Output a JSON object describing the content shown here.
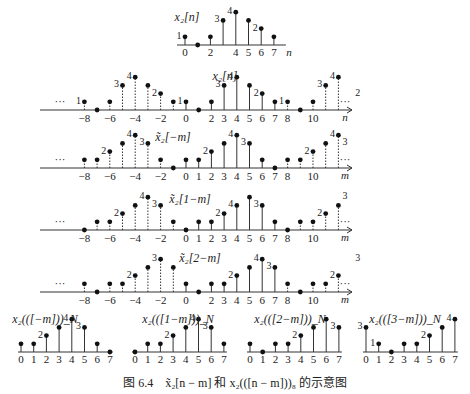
{
  "figure": {
    "caption_prefix": "图 6.4",
    "caption_text": "x̃₂[n − m] 和 x₂(([n − m]))₈ 的示意图"
  },
  "chart_data": [
    {
      "type": "stem",
      "id": "x2",
      "title": "x₂[n]",
      "axis_label": "n",
      "x": [
        0,
        1,
        2,
        3,
        4,
        5,
        6,
        7
      ],
      "values": [
        1,
        0,
        1,
        3,
        4,
        3,
        2,
        1
      ],
      "tick_labels": [
        "0",
        "2",
        "4",
        "5",
        "6",
        "7"
      ],
      "value_labels": {
        "0": "1",
        "3": "3",
        "4": "4",
        "6": "2"
      }
    },
    {
      "type": "stem",
      "id": "x2_periodic",
      "title": "x₂[n]",
      "axis_label": "n",
      "periodic": true,
      "period": 8,
      "x_range": [
        -9,
        14
      ],
      "base_values": [
        1,
        0,
        1,
        3,
        4,
        3,
        2,
        1
      ],
      "tick_labels": [
        "-8",
        "-6",
        "-4",
        "-2",
        "0",
        "2",
        "3",
        "4",
        "5",
        "6",
        "7",
        "8",
        "10"
      ],
      "ellipsis": "···"
    },
    {
      "type": "stem",
      "id": "x2_tilde_neg_m",
      "title": "x̃₂[−m]",
      "axis_label": "m",
      "periodic": true,
      "period": 8,
      "base_values": [
        1,
        1,
        2,
        3,
        4,
        3,
        1,
        0
      ],
      "tick_labels": [
        "-8",
        "-6",
        "-4",
        "-2",
        "0",
        "1",
        "2",
        "3",
        "4",
        "5",
        "6",
        "7",
        "8",
        "10"
      ]
    },
    {
      "type": "stem",
      "id": "x2_tilde_1_minus_m",
      "title": "x̃₂[1−m]",
      "axis_label": "m",
      "periodic": true,
      "period": 8,
      "base_values": [
        0,
        1,
        1,
        2,
        3,
        4,
        3,
        1
      ],
      "tick_labels": [
        "-8",
        "-6",
        "-4",
        "-2",
        "0",
        "1",
        "2",
        "3",
        "4",
        "5",
        "6",
        "7",
        "8",
        "10"
      ]
    },
    {
      "type": "stem",
      "id": "x2_tilde_2_minus_m",
      "title": "x̃₂[2−m]",
      "axis_label": "m",
      "periodic": true,
      "period": 8,
      "base_values": [
        1,
        0,
        1,
        1,
        2,
        3,
        4,
        3
      ],
      "tick_labels": [
        "-8",
        "-6",
        "-4",
        "-2",
        "0",
        "2",
        "3",
        "4",
        "5",
        "6",
        "7",
        "8",
        "10"
      ]
    },
    {
      "type": "stem",
      "id": "x2_circ_neg_m",
      "title": "x₂(([−m]))_N",
      "x": [
        0,
        1,
        2,
        3,
        4,
        5,
        6,
        7
      ],
      "values": [
        1,
        1,
        2,
        3,
        4,
        3,
        1,
        0
      ]
    },
    {
      "type": "stem",
      "id": "x2_circ_1_minus_m",
      "title": "x₂(([1−m]))_N",
      "x": [
        0,
        1,
        2,
        3,
        4,
        5,
        6,
        7
      ],
      "values": [
        0,
        1,
        1,
        2,
        3,
        4,
        3,
        1
      ]
    },
    {
      "type": "stem",
      "id": "x2_circ_2_minus_m",
      "title": "x₂(([2−m]))_N",
      "x": [
        0,
        1,
        2,
        3,
        4,
        5,
        6,
        7
      ],
      "values": [
        1,
        0,
        1,
        1,
        2,
        3,
        4,
        3
      ]
    },
    {
      "type": "stem",
      "id": "x2_circ_3_minus_m",
      "title": "x₂(([3−m]))_N",
      "x": [
        0,
        1,
        2,
        3,
        4,
        5,
        6,
        7
      ],
      "values": [
        3,
        1,
        0,
        1,
        1,
        2,
        3,
        4
      ]
    }
  ]
}
